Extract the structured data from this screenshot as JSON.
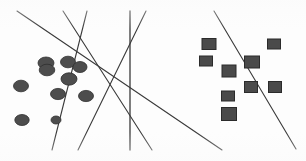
{
  "figure": {
    "background_color": "#fdfdfd",
    "width": 306,
    "height": 161
  },
  "chart_data": {
    "type": "scatter",
    "title": "",
    "subtitle": "",
    "xlabel": "",
    "ylabel": "",
    "xlim": [
      0,
      306
    ],
    "ylim": [
      0,
      161
    ],
    "grid": false,
    "axes_visible": false,
    "tick_labels": [],
    "legend": {
      "visible": false,
      "position": "none",
      "entries": [
        {
          "name": "Class A",
          "marker": "circle",
          "color": "#4d4d4d"
        },
        {
          "name": "Class B",
          "marker": "square",
          "color": "#4a4a4a"
        }
      ]
    },
    "annotations": [],
    "series": [
      {
        "name": "Class A",
        "marker": "circle",
        "color": "#4d4d4d",
        "edge_color": "#2f2f2f",
        "points": [
          {
            "x": 46,
            "y": 63,
            "rx": 8.0,
            "ry": 6.0
          },
          {
            "x": 68,
            "y": 62,
            "rx": 7.5,
            "ry": 5.8
          },
          {
            "x": 80,
            "y": 67,
            "rx": 7.0,
            "ry": 5.5
          },
          {
            "x": 47,
            "y": 70,
            "rx": 7.8,
            "ry": 5.8
          },
          {
            "x": 69,
            "y": 79,
            "rx": 8.0,
            "ry": 6.2
          },
          {
            "x": 21,
            "y": 86,
            "rx": 7.5,
            "ry": 5.8
          },
          {
            "x": 58,
            "y": 94,
            "rx": 7.5,
            "ry": 5.6
          },
          {
            "x": 86,
            "y": 96,
            "rx": 7.5,
            "ry": 5.6
          },
          {
            "x": 22,
            "y": 120,
            "rx": 7.2,
            "ry": 5.5
          },
          {
            "x": 56,
            "y": 120,
            "rx": 5.0,
            "ry": 4.0
          }
        ]
      },
      {
        "name": "Class B",
        "marker": "square",
        "color": "#4a4a4a",
        "edge_color": "#2b2b2b",
        "points": [
          {
            "x": 209,
            "y": 44,
            "w": 14,
            "h": 11
          },
          {
            "x": 274,
            "y": 44,
            "w": 13,
            "h": 10
          },
          {
            "x": 206,
            "y": 61,
            "w": 13,
            "h": 10
          },
          {
            "x": 252,
            "y": 62,
            "w": 15,
            "h": 12
          },
          {
            "x": 229,
            "y": 71,
            "w": 14,
            "h": 12
          },
          {
            "x": 251,
            "y": 87,
            "w": 13,
            "h": 11
          },
          {
            "x": 275,
            "y": 87,
            "w": 13,
            "h": 11
          },
          {
            "x": 228,
            "y": 96,
            "w": 13,
            "h": 10
          },
          {
            "x": 229,
            "y": 114,
            "w": 15,
            "h": 13
          }
        ]
      }
    ],
    "lines": [
      {
        "id": "line-1",
        "x1": 17,
        "y1": 11,
        "x2": 222,
        "y2": 150,
        "color": "#3a3a3a",
        "width": 1.1
      },
      {
        "id": "line-2",
        "x1": 63,
        "y1": 11,
        "x2": 152,
        "y2": 150,
        "color": "#3a3a3a",
        "width": 1.1
      },
      {
        "id": "line-3",
        "x1": 87,
        "y1": 11,
        "x2": 52,
        "y2": 150,
        "color": "#3a3a3a",
        "width": 1.1
      },
      {
        "id": "line-4",
        "x1": 130,
        "y1": 11,
        "x2": 130,
        "y2": 150,
        "color": "#3a3a3a",
        "width": 1.3
      },
      {
        "id": "line-5",
        "x1": 146,
        "y1": 11,
        "x2": 78,
        "y2": 150,
        "color": "#3a3a3a",
        "width": 1.1
      },
      {
        "id": "line-6",
        "x1": 214,
        "y1": 11,
        "x2": 296,
        "y2": 149,
        "color": "#3a3a3a",
        "width": 1.1
      }
    ],
    "counts": {
      "class_a_points": 10,
      "class_b_points": 9,
      "separating_lines": 6
    }
  }
}
